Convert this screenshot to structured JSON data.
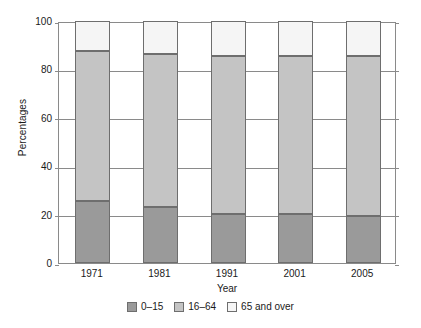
{
  "chart_data": {
    "type": "bar",
    "stacked": true,
    "title": "",
    "xlabel": "Year",
    "ylabel": "Percentages",
    "categories": [
      "1971",
      "1981",
      "1991",
      "2001",
      "2005"
    ],
    "series": [
      {
        "name": "0–15",
        "values": [
          25.5,
          23.0,
          20.4,
          20.2,
          19.5
        ],
        "color": "#9a9a9a"
      },
      {
        "name": "16–64",
        "values": [
          62.0,
          63.5,
          65.1,
          65.3,
          66.0
        ],
        "color": "#c4c4c4"
      },
      {
        "name": "65 and over",
        "values": [
          12.5,
          13.5,
          14.5,
          14.5,
          14.5
        ],
        "color": "#f5f5f5"
      }
    ],
    "segment_tops": {
      "0-15": [
        25.5,
        23.0,
        20.4,
        20.2,
        19.5
      ],
      "16-64": [
        87.5,
        86.5,
        85.5,
        85.5,
        85.5
      ],
      "65 and over": [
        100,
        100,
        100,
        100,
        100
      ]
    },
    "ylim": [
      0,
      100
    ],
    "yticks": [
      "0",
      "20",
      "40",
      "60",
      "80",
      "100"
    ],
    "ytick_values": [
      0,
      20,
      40,
      60,
      80,
      100
    ],
    "grid": true,
    "legend_position": "bottom",
    "border_color": "#6e6e6e",
    "axis_color": "#8a8a8a"
  }
}
